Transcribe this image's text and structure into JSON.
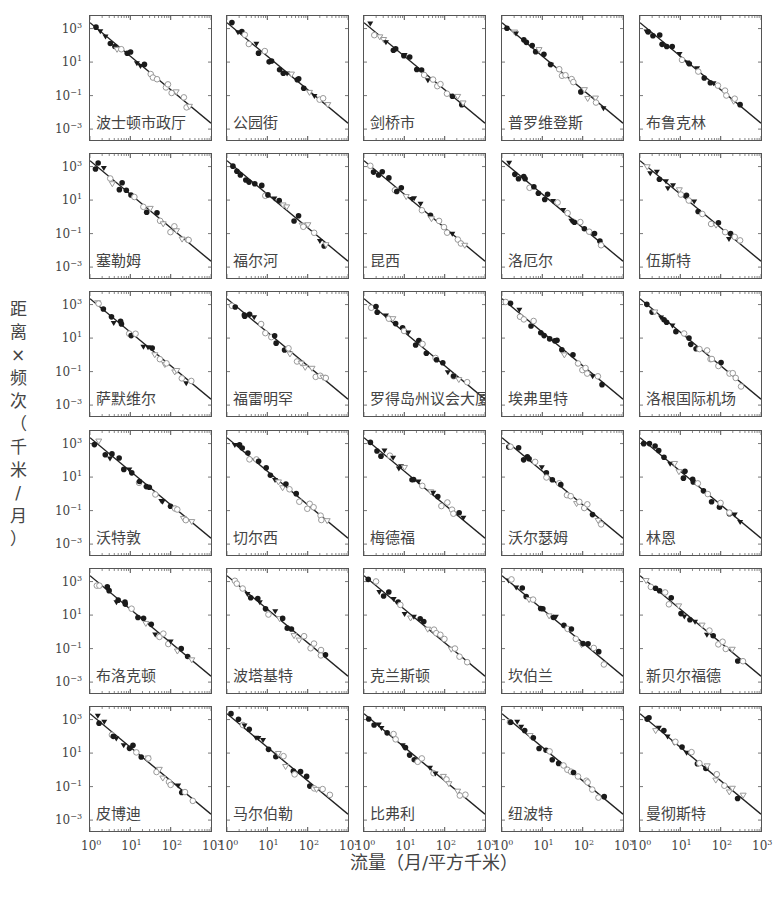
{
  "chart_data": {
    "type": "scatter",
    "layout": "small-multiples 6 rows x 5 columns, log-log axes, shared axes",
    "xlabel": "流量（月/平方千米）",
    "ylabel": "距离×频次（千米/月）",
    "xscale": "log",
    "yscale": "log",
    "xlim": [
      1,
      1000
    ],
    "ylim": [
      0.0003,
      5000
    ],
    "x_tick_labels": [
      "10^0",
      "10^1",
      "10^2",
      "10^3"
    ],
    "y_tick_labels": [
      "10^3",
      "10^1",
      "10^-1",
      "10^-3"
    ],
    "fit_line": {
      "description": "straight power-law line, slope ≈ -2 on log-log axes",
      "slope": -2,
      "y_at_x1": 1000
    },
    "markers": [
      "filled circle",
      "filled triangle",
      "open circle",
      "open triangle"
    ],
    "grid": false,
    "legend": "none",
    "panels": [
      {
        "label": "波士顿市政厅",
        "row": 0,
        "col": 0
      },
      {
        "label": "公园街",
        "row": 0,
        "col": 1
      },
      {
        "label": "剑桥市",
        "row": 0,
        "col": 2
      },
      {
        "label": "普罗维登斯",
        "row": 0,
        "col": 3
      },
      {
        "label": "布鲁克林",
        "row": 0,
        "col": 4
      },
      {
        "label": "塞勒姆",
        "row": 1,
        "col": 0
      },
      {
        "label": "福尔河",
        "row": 1,
        "col": 1
      },
      {
        "label": "昆西",
        "row": 1,
        "col": 2
      },
      {
        "label": "洛厄尔",
        "row": 1,
        "col": 3
      },
      {
        "label": "伍斯特",
        "row": 1,
        "col": 4
      },
      {
        "label": "萨默维尔",
        "row": 2,
        "col": 0
      },
      {
        "label": "福雷明罕",
        "row": 2,
        "col": 1
      },
      {
        "label": "罗得岛州议会大厦",
        "row": 2,
        "col": 2
      },
      {
        "label": "埃弗里特",
        "row": 2,
        "col": 3
      },
      {
        "label": "洛根国际机场",
        "row": 2,
        "col": 4
      },
      {
        "label": "沃特敦",
        "row": 3,
        "col": 0
      },
      {
        "label": "切尔西",
        "row": 3,
        "col": 1
      },
      {
        "label": "梅德福",
        "row": 3,
        "col": 2
      },
      {
        "label": "沃尔瑟姆",
        "row": 3,
        "col": 3
      },
      {
        "label": "林恩",
        "row": 3,
        "col": 4
      },
      {
        "label": "布洛克顿",
        "row": 4,
        "col": 0
      },
      {
        "label": "波塔基特",
        "row": 4,
        "col": 1
      },
      {
        "label": "克兰斯顿",
        "row": 4,
        "col": 2
      },
      {
        "label": "坎伯兰",
        "row": 4,
        "col": 3
      },
      {
        "label": "新贝尔福德",
        "row": 4,
        "col": 4
      },
      {
        "label": "皮博迪",
        "row": 5,
        "col": 0
      },
      {
        "label": "马尔伯勒",
        "row": 5,
        "col": 1
      },
      {
        "label": "比弗利",
        "row": 5,
        "col": 2
      },
      {
        "label": "纽波特",
        "row": 5,
        "col": 3
      },
      {
        "label": "曼彻斯特",
        "row": 5,
        "col": 4
      }
    ]
  },
  "axes": {
    "ylabel_chars": [
      "距",
      "离",
      "×",
      "频",
      "次",
      "（",
      "千",
      "米",
      "/",
      "月",
      "）"
    ],
    "xlabel": "流量（月/平方千米）",
    "y_ticks": [
      {
        "base": "10",
        "exp": "3"
      },
      {
        "base": "10",
        "exp": "1"
      },
      {
        "base": "10",
        "exp": "−1"
      },
      {
        "base": "10",
        "exp": "−3"
      }
    ],
    "x_ticks": [
      {
        "base": "10",
        "exp": "0"
      },
      {
        "base": "10",
        "exp": "1"
      },
      {
        "base": "10",
        "exp": "2"
      },
      {
        "base": "10",
        "exp": "3"
      }
    ]
  },
  "colors": {
    "line": "#222222",
    "filled": "#1a1a1a",
    "open": "#9a9a9a",
    "frame": "#555555"
  }
}
